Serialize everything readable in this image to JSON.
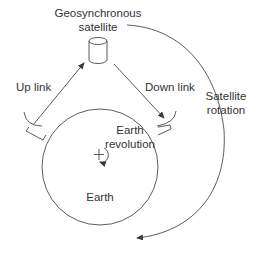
{
  "diagram": {
    "labels": {
      "satellite_line1": "Geosynchronous",
      "satellite_line2": "satellite",
      "up_link": "Up link",
      "down_link": "Down link",
      "satellite_rotation_line1": "Satellite",
      "satellite_rotation_line2": "rotation",
      "earth_revolution_line1": "Earth",
      "earth_revolution_line2": "revolution",
      "earth": "Earth"
    },
    "colors": {
      "line": "#4a4a4a",
      "text": "#333333",
      "background": "#ffffff"
    }
  }
}
